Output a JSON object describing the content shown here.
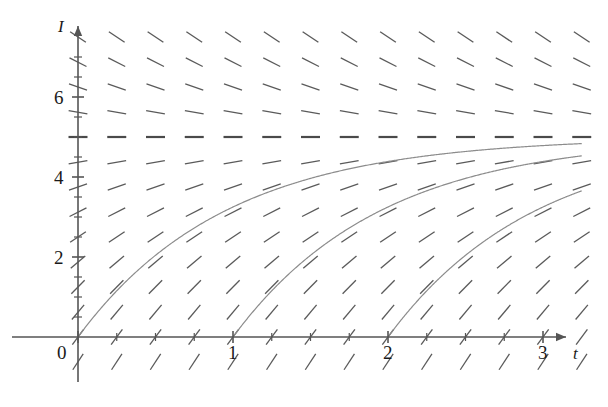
{
  "figure": {
    "kind": "slope-field-with-solution-curves",
    "background_color": "#ffffff",
    "width": 608,
    "height": 407
  },
  "axes": {
    "x_axis_label": "t",
    "y_axis_label": "I",
    "x_ticks": [
      "0",
      "1",
      "2",
      "3"
    ],
    "y_ticks": [
      "2",
      "4",
      "6"
    ],
    "origin_label": "0",
    "axis_color": "#555555"
  },
  "chart_data": {
    "type": "line",
    "title": "",
    "xlabel": "t",
    "ylabel": "I",
    "xlim": [
      -0.12,
      3.25
    ],
    "ylim": [
      -0.9,
      8.1
    ],
    "grid": false,
    "legend": null,
    "x_ticks": [
      0,
      1,
      2,
      3
    ],
    "x_tick_labels": [
      "0",
      "1",
      "2",
      "3"
    ],
    "y_ticks": [
      2,
      4,
      6
    ],
    "y_tick_labels": [
      "2",
      "4",
      "6"
    ],
    "x_minor_ticks": [
      0.25,
      0.5,
      0.75,
      1.25,
      1.5,
      1.75,
      2.25,
      2.5,
      2.75
    ],
    "y_minor_ticks": [
      0.5,
      1,
      1.5,
      2.5,
      3,
      3.5,
      4.5,
      5,
      5.5,
      6.5,
      7
    ],
    "equilibrium": {
      "value": 5,
      "style": "dashed-horizontal-slope-marks",
      "color": "#4a4a4a"
    },
    "slope_field": {
      "equation": "dI/dt = k (5 - I)",
      "k": 1.05,
      "color": "#5a5a5a",
      "segment_length_px": 19,
      "x_grid": [
        0.0,
        0.25,
        0.5,
        0.75,
        1.0,
        1.25,
        1.5,
        1.75,
        2.0,
        2.25,
        2.5,
        2.75,
        3.0,
        3.25
      ],
      "y_grid": [
        -0.62,
        0.0,
        0.62,
        1.25,
        1.87,
        2.5,
        3.12,
        3.75,
        4.37,
        5.0,
        5.62,
        6.25,
        6.87,
        7.5
      ]
    },
    "series": [
      {
        "name": "solution-curve-t0",
        "color": "#8c8c8c",
        "t0": 0,
        "I0": 0,
        "asymptote": 5,
        "formula": "I(t) = 5 (1 - e^(-1.05 (t - 0)))"
      },
      {
        "name": "solution-curve-t1",
        "color": "#8c8c8c",
        "t0": 1,
        "I0": 0,
        "asymptote": 5,
        "formula": "I(t) = 5 (1 - e^(-1.05 (t - 1)))"
      },
      {
        "name": "solution-curve-t2",
        "color": "#8c8c8c",
        "t0": 2,
        "I0": 0,
        "asymptote": 5,
        "formula": "I(t) = 5 (1 - e^(-1.05 (t - 2)))"
      }
    ]
  }
}
